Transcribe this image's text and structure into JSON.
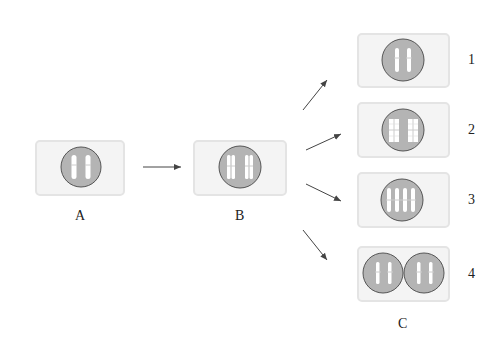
{
  "diagram": {
    "colors": {
      "box_fill": "#f4f4f4",
      "box_border": "#e4e4e4",
      "nucleus_fill": "#b4b4b4",
      "nucleus_border": "#555555",
      "chromosome": "#ffffff",
      "arrow": "#444444"
    },
    "stages": [
      {
        "id": "A",
        "label": "A",
        "description": "cell with 2 single chromosomes"
      },
      {
        "id": "B",
        "label": "B",
        "description": "cell with 2 replicated chromosomes (sister chromatids)"
      }
    ],
    "outcomes_group_label": "C",
    "outcomes": [
      {
        "id": "1",
        "label": "1",
        "description": "cell with 2 single chromosomes"
      },
      {
        "id": "2",
        "label": "2",
        "description": "cell with 2 replicated chromosomes with cross connections"
      },
      {
        "id": "3",
        "label": "3",
        "description": "cell with 4 chromosomes"
      },
      {
        "id": "4",
        "label": "4",
        "description": "two cells each with 2 chromosomes"
      }
    ],
    "arrows": [
      {
        "from": "A",
        "to": "B"
      },
      {
        "from": "B",
        "to": "1"
      },
      {
        "from": "B",
        "to": "2"
      },
      {
        "from": "B",
        "to": "3"
      },
      {
        "from": "B",
        "to": "4"
      }
    ]
  }
}
